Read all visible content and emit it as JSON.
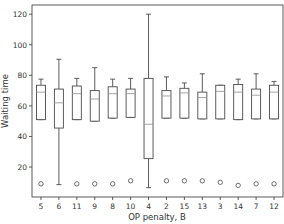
{
  "chart_data": {
    "type": "boxplot",
    "title": "",
    "xlabel": "OP penalty, B",
    "ylabel": "Waiting time",
    "ylim": [
      0.4,
      126
    ],
    "yticks": [
      20,
      40,
      60,
      80,
      100,
      120
    ],
    "grid": false,
    "legend": null,
    "categories": [
      "5",
      "6",
      "11",
      "9",
      "8",
      "10",
      "4",
      "2",
      "15",
      "13",
      "3",
      "14",
      "7",
      "12"
    ],
    "boxes": [
      {
        "label": "5",
        "whislo": 51,
        "q1": 51,
        "med": 69,
        "q3": 73.5,
        "whishi": 77.5,
        "fliers": [
          9
        ]
      },
      {
        "label": "6",
        "whislo": 8.5,
        "q1": 45.5,
        "med": 62,
        "q3": 71,
        "whishi": 90.5,
        "fliers": []
      },
      {
        "label": "11",
        "whislo": 51,
        "q1": 51,
        "med": 68,
        "q3": 73,
        "whishi": 78,
        "fliers": [
          9
        ]
      },
      {
        "label": "9",
        "whislo": 50,
        "q1": 50,
        "med": 64.5,
        "q3": 70,
        "whishi": 85,
        "fliers": [
          9
        ]
      },
      {
        "label": "8",
        "whislo": 52,
        "q1": 52,
        "med": 68,
        "q3": 72.5,
        "whishi": 77.5,
        "fliers": [
          9
        ]
      },
      {
        "label": "10",
        "whislo": 52.5,
        "q1": 52.5,
        "med": 68,
        "q3": 71,
        "whishi": 78,
        "fliers": [
          11
        ]
      },
      {
        "label": "4",
        "whislo": 6.5,
        "q1": 25.5,
        "med": 48,
        "q3": 78,
        "whishi": 120,
        "fliers": []
      },
      {
        "label": "2",
        "whislo": 52,
        "q1": 52,
        "med": 66.5,
        "q3": 70,
        "whishi": 79,
        "fliers": [
          11
        ]
      },
      {
        "label": "15",
        "whislo": 52,
        "q1": 52,
        "med": 68.5,
        "q3": 71.5,
        "whishi": 75,
        "fliers": [
          11
        ]
      },
      {
        "label": "13",
        "whislo": 51.5,
        "q1": 51.5,
        "med": 65.5,
        "q3": 69,
        "whishi": 81,
        "fliers": [
          11
        ]
      },
      {
        "label": "3",
        "whislo": 51.5,
        "q1": 51.5,
        "med": 69.5,
        "q3": 73.5,
        "whishi": 73.5,
        "fliers": [
          10
        ]
      },
      {
        "label": "14",
        "whislo": 51,
        "q1": 51,
        "med": 69,
        "q3": 74,
        "whishi": 77.5,
        "fliers": [
          8
        ]
      },
      {
        "label": "7",
        "whislo": 51.5,
        "q1": 51.5,
        "med": 67,
        "q3": 71,
        "whishi": 81,
        "fliers": [
          9
        ]
      },
      {
        "label": "12",
        "whislo": 51.5,
        "q1": 51.5,
        "med": 69,
        "q3": 73.5,
        "whishi": 76,
        "fliers": [
          9
        ]
      }
    ],
    "colors": {
      "box": "#4a4a4a",
      "median": "#9a9a9a",
      "axis": "#333333"
    }
  }
}
